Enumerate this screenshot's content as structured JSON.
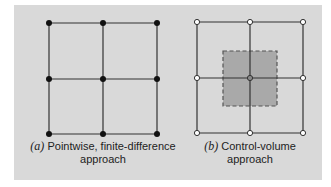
{
  "figure": {
    "panel_a": {
      "label": "(a)",
      "caption_line1": "Pointwise, finite-difference",
      "caption_line2": "approach",
      "node_style": "filled-dot",
      "nodes_x": [
        49,
        103,
        157
      ],
      "nodes_y": [
        23,
        79,
        134
      ]
    },
    "panel_b": {
      "label": "(b)",
      "caption_line1": "Control-volume",
      "caption_line2": "approach",
      "node_style": "hollow-circle",
      "nodes_x": [
        197,
        250,
        303
      ],
      "nodes_y": [
        22,
        78,
        133
      ],
      "control_volume": {
        "x": 223,
        "y": 51,
        "width": 54,
        "height": 55,
        "fill": "#a9a9a9",
        "border": "dashed"
      }
    },
    "colors": {
      "background": "#d9d9d9",
      "line": "#333333",
      "shade": "#a9a9a9"
    }
  }
}
